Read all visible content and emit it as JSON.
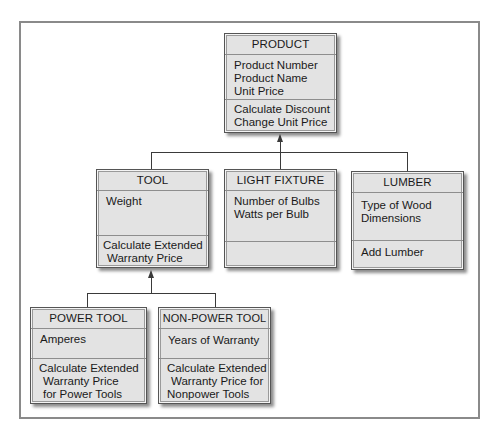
{
  "diagram": {
    "type": "uml-class-inheritance",
    "classes": {
      "product": {
        "name": "PRODUCT",
        "attributes": [
          "Product Number",
          "Product Name",
          "Unit Price"
        ],
        "methods": [
          "Calculate Discount",
          "Change Unit Price"
        ]
      },
      "tool": {
        "name": "TOOL",
        "attributes": [
          "Weight"
        ],
        "methods": [
          "Calculate Extended",
          "Warranty Price"
        ]
      },
      "light_fixture": {
        "name": "LIGHT FIXTURE",
        "attributes": [
          "Number of Bulbs",
          "Watts per Bulb"
        ],
        "methods": []
      },
      "lumber": {
        "name": "LUMBER",
        "attributes": [
          "Type of Wood",
          "Dimensions"
        ],
        "methods": [
          "Add Lumber"
        ]
      },
      "power_tool": {
        "name": "POWER TOOL",
        "attributes": [
          "Amperes"
        ],
        "methods": [
          "Calculate Extended",
          "Warranty Price",
          "for Power Tools"
        ]
      },
      "non_power_tool": {
        "name": "NON-POWER TOOL",
        "attributes": [
          "Years of Warranty"
        ],
        "methods": [
          "Calculate Extended",
          "Warranty Price for",
          "Nonpower Tools"
        ]
      }
    },
    "relationships": [
      {
        "child": "TOOL",
        "parent": "PRODUCT",
        "type": "inheritance"
      },
      {
        "child": "LIGHT FIXTURE",
        "parent": "PRODUCT",
        "type": "inheritance"
      },
      {
        "child": "LUMBER",
        "parent": "PRODUCT",
        "type": "inheritance"
      },
      {
        "child": "POWER TOOL",
        "parent": "TOOL",
        "type": "inheritance"
      },
      {
        "child": "NON-POWER TOOL",
        "parent": "TOOL",
        "type": "inheritance"
      }
    ],
    "colors": {
      "box_fill": "#e3e3e3",
      "box_border": "#555555",
      "connector": "#3a3a3a",
      "frame": "#8a8a8a"
    }
  }
}
